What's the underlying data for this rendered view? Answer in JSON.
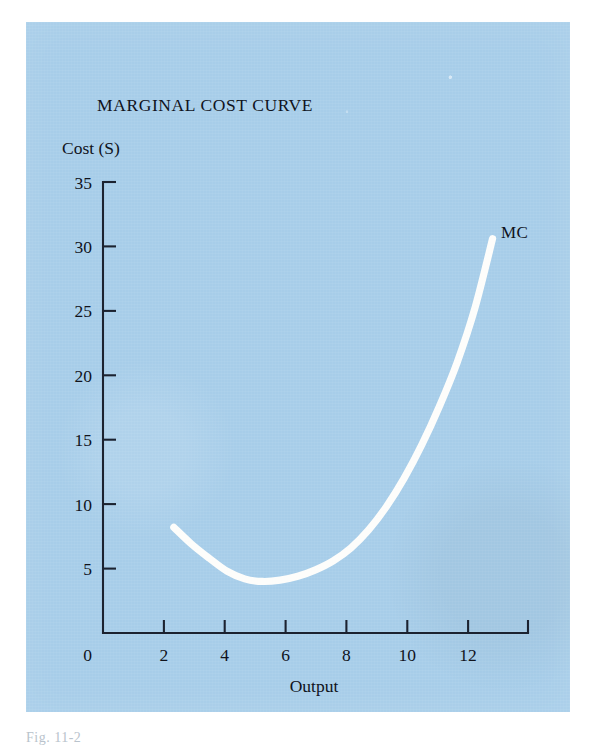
{
  "figure": {
    "panel_color": "#a7cde9",
    "curve_color": "#fdfdfb",
    "axis_color": "#1b2230",
    "title": "MARGINAL COST CURVE",
    "caption": "Fig. 11-2"
  },
  "chart_data": {
    "type": "line",
    "title": "MARGINAL COST CURVE",
    "xlabel": "Output",
    "ylabel": "Cost (S)",
    "xlim": [
      0,
      12
    ],
    "ylim": [
      0,
      35
    ],
    "grid": false,
    "legend_position": "inline-end-of-line",
    "x_ticks": [
      0,
      2,
      4,
      6,
      8,
      10,
      12
    ],
    "x_tick_labels": [
      "0",
      "2",
      "4",
      "6",
      "8",
      "10",
      "12"
    ],
    "y_ticks": [
      0,
      5,
      10,
      15,
      20,
      25,
      30,
      35
    ],
    "y_tick_labels": [
      "0",
      "5",
      "10",
      "15",
      "20",
      "25",
      "30",
      "35"
    ],
    "series": [
      {
        "name": "MC",
        "annotation": "MC",
        "x": [
          2.0,
          2.5,
          3.0,
          3.5,
          4.0,
          4.5,
          5.0,
          5.5,
          6.0,
          6.5,
          7.0,
          7.5,
          8.0,
          8.5,
          9.0,
          9.5,
          10.0,
          10.5,
          11.0
        ],
        "y": [
          8.2,
          6.9,
          5.8,
          4.8,
          4.2,
          4.0,
          4.1,
          4.4,
          4.9,
          5.6,
          6.6,
          8.0,
          9.8,
          12.0,
          14.6,
          17.6,
          21.0,
          25.2,
          30.6
        ]
      }
    ]
  }
}
